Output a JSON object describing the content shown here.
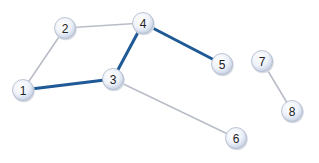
{
  "colors": {
    "highlight_edge": "#1f5a96",
    "normal_edge": "#b9bdc7",
    "node_fill_center": "#ffffff",
    "node_fill_edge": "#c9d3e6",
    "node_stroke": "#aeb7c8",
    "label": "#222222"
  },
  "nodes": [
    {
      "id": "1",
      "label": "1",
      "x": 23,
      "y": 90
    },
    {
      "id": "2",
      "label": "2",
      "x": 65,
      "y": 28
    },
    {
      "id": "3",
      "label": "3",
      "x": 113,
      "y": 79
    },
    {
      "id": "4",
      "label": "4",
      "x": 143,
      "y": 23
    },
    {
      "id": "5",
      "label": "5",
      "x": 222,
      "y": 64
    },
    {
      "id": "6",
      "label": "6",
      "x": 236,
      "y": 138
    },
    {
      "id": "7",
      "label": "7",
      "x": 262,
      "y": 61
    },
    {
      "id": "8",
      "label": "8",
      "x": 292,
      "y": 111
    }
  ],
  "edges": [
    {
      "from": "1",
      "to": "2",
      "highlighted": false
    },
    {
      "from": "2",
      "to": "4",
      "highlighted": false
    },
    {
      "from": "1",
      "to": "3",
      "highlighted": true
    },
    {
      "from": "3",
      "to": "4",
      "highlighted": true
    },
    {
      "from": "4",
      "to": "5",
      "highlighted": true
    },
    {
      "from": "3",
      "to": "6",
      "highlighted": false
    },
    {
      "from": "7",
      "to": "8",
      "highlighted": false
    }
  ]
}
